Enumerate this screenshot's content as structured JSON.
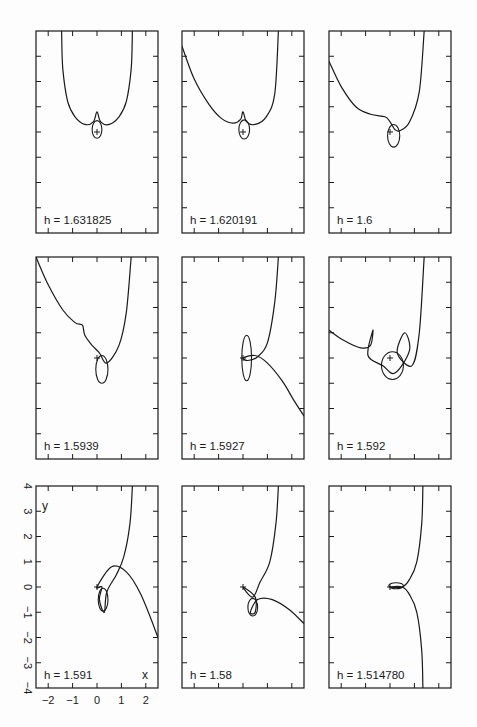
{
  "figure": {
    "page_number": "",
    "rows": 3,
    "cols": 3
  },
  "chart_data": {
    "type": "line",
    "title": "",
    "xlabel": "x",
    "ylabel": "y",
    "xlim": [
      -2.5,
      2.5
    ],
    "ylim": [
      -4,
      4
    ],
    "xticks": [
      -2,
      -1,
      0,
      1,
      2
    ],
    "yticks": [
      -4,
      -3,
      -2,
      -1,
      0,
      1,
      2,
      3,
      4
    ],
    "xtick_labels": [
      "−2",
      "−1",
      "0",
      "1",
      "2"
    ],
    "ytick_labels": [
      "−4",
      "−3",
      "−2",
      "−1",
      "0",
      "1",
      "2",
      "3",
      "4"
    ],
    "grid": false,
    "axis_labels_shown_on": "bottom-left panel only",
    "panels": [
      {
        "label": "h = 1.631825",
        "h": 1.631825,
        "row": 0,
        "col": 0,
        "path": [
          [
            -1.45,
            4.0
          ],
          [
            -1.4,
            2.5
          ],
          [
            -1.2,
            1.2
          ],
          [
            -0.9,
            0.6
          ],
          [
            -0.5,
            0.3
          ],
          [
            -0.15,
            0.4
          ],
          [
            0,
            0.8
          ],
          [
            0.15,
            0.4
          ],
          [
            0.5,
            0.3
          ],
          [
            0.9,
            0.6
          ],
          [
            1.2,
            1.2
          ],
          [
            1.4,
            2.5
          ],
          [
            1.45,
            4.0
          ]
        ],
        "loop": {
          "cx": 0,
          "cy": 0.1,
          "rx": 0.2,
          "ry": 0.35
        }
      },
      {
        "label": "h = 1.620191",
        "h": 1.620191,
        "row": 0,
        "col": 1,
        "path": [
          [
            -2.5,
            3.4
          ],
          [
            -2.0,
            2.1
          ],
          [
            -1.4,
            1.1
          ],
          [
            -0.9,
            0.55
          ],
          [
            -0.4,
            0.35
          ],
          [
            -0.1,
            0.5
          ],
          [
            0,
            0.8
          ],
          [
            0.15,
            0.4
          ],
          [
            0.5,
            0.3
          ],
          [
            0.95,
            0.6
          ],
          [
            1.3,
            1.5
          ],
          [
            1.45,
            4.0
          ]
        ],
        "loop": {
          "cx": 0.05,
          "cy": 0.1,
          "rx": 0.22,
          "ry": 0.38
        }
      },
      {
        "label": "h = 1.6",
        "h": 1.6,
        "row": 0,
        "col": 2,
        "path": [
          [
            -2.5,
            2.8
          ],
          [
            -2.0,
            1.8
          ],
          [
            -1.4,
            1.0
          ],
          [
            -0.8,
            0.7
          ],
          [
            -0.2,
            0.6
          ],
          [
            0,
            0.4
          ],
          [
            0.2,
            0.1
          ],
          [
            0.4,
            0.05
          ],
          [
            0.8,
            0.4
          ],
          [
            1.2,
            1.6
          ],
          [
            1.4,
            4.0
          ]
        ],
        "loop": {
          "cx": 0.15,
          "cy": -0.15,
          "rx": 0.25,
          "ry": 0.45
        }
      },
      {
        "label": "h = 1.5939",
        "h": 1.5939,
        "row": 1,
        "col": 0,
        "path": [
          [
            -2.5,
            4.0
          ],
          [
            -2.0,
            2.9
          ],
          [
            -1.4,
            1.9
          ],
          [
            -0.9,
            1.4
          ],
          [
            -0.6,
            1.3
          ],
          [
            -0.5,
            0.9
          ],
          [
            -0.2,
            0.5
          ],
          [
            0.1,
            0.2
          ],
          [
            0.4,
            -0.2
          ],
          [
            0.9,
            0.5
          ],
          [
            1.2,
            1.8
          ],
          [
            1.4,
            4.0
          ]
        ],
        "loop": {
          "cx": 0.2,
          "cy": -0.45,
          "rx": 0.25,
          "ry": 0.55
        }
      },
      {
        "label": "h = 1.5927",
        "h": 1.5927,
        "row": 1,
        "col": 1,
        "path": [
          [
            1.45,
            4.0
          ],
          [
            1.3,
            2.2
          ],
          [
            1.0,
            0.6
          ],
          [
            0.6,
            0.05
          ],
          [
            0.2,
            -0.1
          ],
          [
            0,
            0
          ],
          [
            0.5,
            0.1
          ],
          [
            1.0,
            -0.2
          ],
          [
            1.6,
            -0.9
          ],
          [
            2.1,
            -1.7
          ],
          [
            2.5,
            -2.3
          ]
        ],
        "loop": {
          "cx": 0.15,
          "cy": 0.0,
          "rx": 0.2,
          "ry": 0.9
        }
      },
      {
        "label": "h = 1.592",
        "h": 1.592,
        "row": 1,
        "col": 2,
        "path": [
          [
            -2.5,
            1.1
          ],
          [
            -1.9,
            0.7
          ],
          [
            -1.2,
            0.4
          ],
          [
            -0.8,
            0.5
          ],
          [
            -0.7,
            1.1
          ],
          [
            -0.9,
            0.1
          ],
          [
            -0.3,
            -0.3
          ],
          [
            0.2,
            -0.6
          ],
          [
            0.8,
            0.3
          ],
          [
            0.6,
            1.0
          ],
          [
            0.3,
            0.2
          ],
          [
            0.9,
            -0.3
          ],
          [
            1.2,
            1.0
          ],
          [
            1.4,
            4.0
          ]
        ],
        "loop": {
          "cx": 0.1,
          "cy": -0.3,
          "rx": 0.45,
          "ry": 0.55
        }
      },
      {
        "label": "h = 1.591",
        "h": 1.591,
        "row": 2,
        "col": 0,
        "path": [
          [
            1.45,
            4.0
          ],
          [
            1.35,
            2.5
          ],
          [
            1.1,
            1.2
          ],
          [
            0.8,
            0.5
          ],
          [
            0.4,
            -0.2
          ],
          [
            0.3,
            -1.0
          ],
          [
            0.1,
            -0.5
          ],
          [
            0.2,
            0.0
          ],
          [
            0,
            0
          ],
          [
            0.6,
            0.8
          ],
          [
            1.2,
            0.6
          ],
          [
            1.8,
            -0.3
          ],
          [
            2.5,
            -2.0
          ]
        ],
        "loop": {
          "cx": 0.25,
          "cy": -0.5,
          "rx": 0.2,
          "ry": 0.45
        }
      },
      {
        "label": "h = 1.58",
        "h": 1.58,
        "row": 2,
        "col": 1,
        "path": [
          [
            1.45,
            4.0
          ],
          [
            1.35,
            2.5
          ],
          [
            1.1,
            1.0
          ],
          [
            0.7,
            0.2
          ],
          [
            0.4,
            -0.4
          ],
          [
            0.0,
            0.0
          ],
          [
            0.5,
            -0.4
          ],
          [
            0.5,
            -1.0
          ],
          [
            0.3,
            -1.0
          ],
          [
            0.6,
            -0.5
          ],
          [
            1.2,
            -0.5
          ],
          [
            1.9,
            -0.9
          ],
          [
            2.5,
            -1.45
          ]
        ],
        "loop": {
          "cx": 0.4,
          "cy": -0.8,
          "rx": 0.2,
          "ry": 0.35
        }
      },
      {
        "label": "h = 1.514780",
        "h": 1.51478,
        "row": 2,
        "col": 2,
        "path": [
          [
            1.35,
            4.0
          ],
          [
            1.3,
            2.5
          ],
          [
            1.1,
            1.0
          ],
          [
            0.8,
            0.3
          ],
          [
            0.5,
            0.0
          ],
          [
            0.0,
            0.0
          ],
          [
            0.5,
            0.0
          ],
          [
            0.8,
            -0.3
          ],
          [
            1.1,
            -1.0
          ],
          [
            1.3,
            -2.5
          ],
          [
            1.35,
            -4.0
          ]
        ],
        "loop": {
          "cx": 0.25,
          "cy": 0.05,
          "rx": 0.3,
          "ry": 0.12
        }
      }
    ]
  },
  "axis": {
    "x_symbol": "x",
    "y_symbol": "y",
    "x_labels": [
      "−2",
      "−1",
      "0",
      "1",
      "2"
    ],
    "y_labels": [
      "4",
      "3",
      "2",
      "1",
      "0",
      "−1",
      "−2",
      "−3",
      "−4"
    ]
  },
  "colors": {
    "ink": "#1a1a1a",
    "paper": "#fdfdfd"
  }
}
